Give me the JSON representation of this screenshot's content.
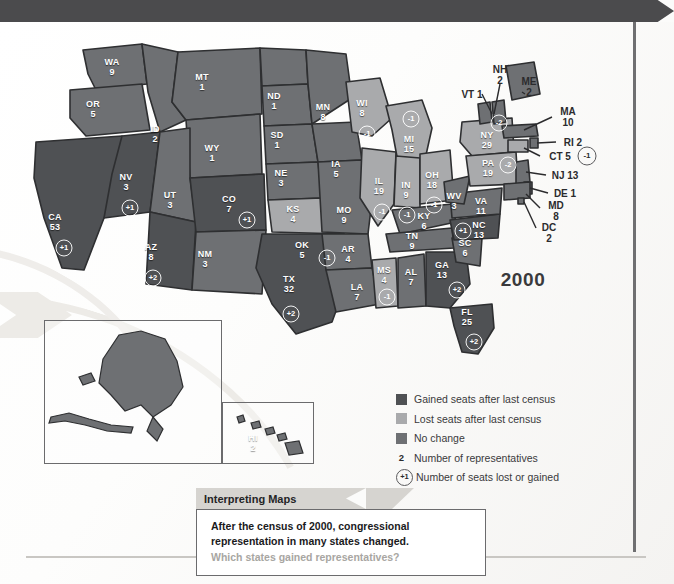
{
  "map": {
    "year_label": "2000",
    "title_hidden": "",
    "colors": {
      "gained": "#4f5154",
      "lost": "#a9aaac",
      "no_change": "#6e7073",
      "border": "#2e2f31",
      "banner": "#4b4b4d",
      "paper": "#fbfbfa",
      "question_gray": "#a8a6a2"
    },
    "states": [
      {
        "code": "WA",
        "seats": "9",
        "change": null,
        "status": "no_change",
        "x": 112,
        "y": 45
      },
      {
        "code": "OR",
        "seats": "5",
        "change": null,
        "status": "no_change",
        "x": 93,
        "y": 87
      },
      {
        "code": "CA",
        "seats": "53",
        "change": "+1",
        "status": "gained",
        "x": 55,
        "y": 200,
        "bx": 64,
        "by": 226
      },
      {
        "code": "NV",
        "seats": "3",
        "change": "+1",
        "status": "gained",
        "x": 126,
        "y": 160,
        "bx": 130,
        "by": 186
      },
      {
        "code": "ID",
        "seats": "2",
        "change": null,
        "status": "no_change",
        "x": 155,
        "y": 112
      },
      {
        "code": "MT",
        "seats": "1",
        "change": null,
        "status": "no_change",
        "x": 202,
        "y": 60
      },
      {
        "code": "WY",
        "seats": "1",
        "change": null,
        "status": "no_change",
        "x": 212,
        "y": 131
      },
      {
        "code": "UT",
        "seats": "3",
        "change": null,
        "status": "no_change",
        "x": 170,
        "y": 178
      },
      {
        "code": "AZ",
        "seats": "8",
        "change": "+2",
        "status": "gained",
        "x": 151,
        "y": 230,
        "bx": 153,
        "by": 256
      },
      {
        "code": "CO",
        "seats": "7",
        "change": "+1",
        "status": "gained",
        "x": 229,
        "y": 182,
        "bx": 247,
        "by": 198
      },
      {
        "code": "NM",
        "seats": "3",
        "change": null,
        "status": "no_change",
        "x": 205,
        "y": 237
      },
      {
        "code": "ND",
        "seats": "1",
        "change": null,
        "status": "no_change",
        "x": 274,
        "y": 79
      },
      {
        "code": "SD",
        "seats": "1",
        "change": null,
        "status": "no_change",
        "x": 277,
        "y": 118
      },
      {
        "code": "NE",
        "seats": "3",
        "change": null,
        "status": "no_change",
        "x": 281,
        "y": 156
      },
      {
        "code": "KS",
        "seats": "4",
        "change": null,
        "status": "no_change",
        "x": 293,
        "y": 192
      },
      {
        "code": "OK",
        "seats": "5",
        "change": "-1",
        "status": "lost",
        "x": 302,
        "y": 228,
        "bx": 327,
        "by": 236
      },
      {
        "code": "TX",
        "seats": "32",
        "change": "+2",
        "status": "gained",
        "x": 289,
        "y": 262,
        "bx": 291,
        "by": 292
      },
      {
        "code": "MN",
        "seats": "8",
        "change": null,
        "status": "no_change",
        "x": 323,
        "y": 90
      },
      {
        "code": "IA",
        "seats": "5",
        "change": null,
        "status": "no_change",
        "x": 336,
        "y": 147
      },
      {
        "code": "MO",
        "seats": "9",
        "change": null,
        "status": "no_change",
        "x": 344,
        "y": 193
      },
      {
        "code": "AR",
        "seats": "4",
        "change": null,
        "status": "no_change",
        "x": 348,
        "y": 232
      },
      {
        "code": "LA",
        "seats": "7",
        "change": null,
        "status": "no_change",
        "x": 357,
        "y": 270
      },
      {
        "code": "WI",
        "seats": "8",
        "change": "-1",
        "status": "lost",
        "x": 362,
        "y": 86,
        "bx": 367,
        "by": 112
      },
      {
        "code": "IL",
        "seats": "19",
        "change": "-1",
        "status": "lost",
        "x": 379,
        "y": 164,
        "bx": 382,
        "by": 190
      },
      {
        "code": "MI",
        "seats": "15",
        "change": "-1",
        "status": "lost",
        "x": 409,
        "y": 122,
        "bx": 411,
        "by": 97
      },
      {
        "code": "IN",
        "seats": "9",
        "change": "-1",
        "status": "lost",
        "x": 406,
        "y": 168,
        "bx": 407,
        "by": 193
      },
      {
        "code": "OH",
        "seats": "18",
        "change": "-1",
        "status": "lost",
        "x": 432,
        "y": 158,
        "bx": 434,
        "by": 183
      },
      {
        "code": "KY",
        "seats": "6",
        "change": null,
        "status": "no_change",
        "x": 424,
        "y": 199
      },
      {
        "code": "TN",
        "seats": "9",
        "change": null,
        "status": "no_change",
        "x": 412,
        "y": 219
      },
      {
        "code": "MS",
        "seats": "4",
        "change": "-1",
        "status": "lost",
        "x": 384,
        "y": 253,
        "bx": 387,
        "by": 275
      },
      {
        "code": "AL",
        "seats": "7",
        "change": null,
        "status": "no_change",
        "x": 411,
        "y": 255
      },
      {
        "code": "GA",
        "seats": "13",
        "change": "+2",
        "status": "gained",
        "x": 442,
        "y": 248,
        "bx": 457,
        "by": 268
      },
      {
        "code": "FL",
        "seats": "25",
        "change": "+2",
        "status": "gained",
        "x": 467,
        "y": 295,
        "bx": 474,
        "by": 320
      },
      {
        "code": "SC",
        "seats": "6",
        "change": null,
        "status": "no_change",
        "x": 465,
        "y": 226
      },
      {
        "code": "NC",
        "seats": "13",
        "change": "+1",
        "status": "gained",
        "x": 479,
        "y": 208,
        "bx": 463,
        "by": 209
      },
      {
        "code": "VA",
        "seats": "11",
        "change": null,
        "status": "no_change",
        "x": 481,
        "y": 184
      },
      {
        "code": "WV",
        "seats": "3",
        "change": null,
        "status": "no_change",
        "x": 454,
        "y": 179
      },
      {
        "code": "NY",
        "seats": "29",
        "change": "-2",
        "status": "lost",
        "x": 487,
        "y": 118,
        "bx": 499,
        "by": 101
      },
      {
        "code": "PA",
        "seats": "19",
        "change": "-2",
        "status": "lost",
        "x": 488,
        "y": 146,
        "bx": 508,
        "by": 143
      }
    ],
    "insets": [
      {
        "code": "AK",
        "seats": "1",
        "status": "no_change",
        "x": 127,
        "y": 352
      },
      {
        "code": "HI",
        "seats": "2",
        "status": "no_change",
        "x": 253,
        "y": 421
      }
    ],
    "callouts": [
      {
        "code": "NH",
        "seats": "2",
        "text": "NH\n2",
        "x": 500,
        "y": 53
      },
      {
        "code": "ME",
        "seats": "2",
        "text": "ME\n2",
        "x": 529,
        "y": 65
      },
      {
        "code": "VT",
        "seats": "1",
        "text": "VT 1",
        "x": 472,
        "y": 72
      },
      {
        "code": "MA",
        "seats": "10",
        "text": "MA\n10",
        "x": 568,
        "y": 95
      },
      {
        "code": "RI",
        "seats": "2",
        "text": "RI 2",
        "x": 573,
        "y": 120
      },
      {
        "code": "CT",
        "seats": "5",
        "text": "CT 5",
        "x": 560,
        "y": 134,
        "badge": "-1",
        "bx": 587,
        "by": 134
      },
      {
        "code": "NJ",
        "seats": "13",
        "text": "NJ 13",
        "x": 565,
        "y": 153
      },
      {
        "code": "DE",
        "seats": "1",
        "text": "DE 1",
        "x": 565,
        "y": 171
      },
      {
        "code": "MD",
        "seats": "8",
        "text": "MD\n8",
        "x": 556,
        "y": 189
      },
      {
        "code": "DC",
        "seats": "2",
        "text": "DC\n2",
        "x": 549,
        "y": 211
      }
    ]
  },
  "legend": {
    "items": [
      {
        "marker": "swatch-gained",
        "label": "Gained seats after last census"
      },
      {
        "marker": "swatch-lost",
        "label": "Lost seats after last census"
      },
      {
        "marker": "swatch-no-change",
        "label": "No change"
      },
      {
        "marker": "number-2",
        "label": "Number of representatives",
        "symbol": "2"
      },
      {
        "marker": "circle-plus-one",
        "label": "Number of seats lost or gained",
        "symbol": "+1"
      }
    ]
  },
  "caption": {
    "tab_title": "Interpreting Maps",
    "line1": "After the census of 2000, congressional",
    "line2": "representation in many states changed.",
    "question": "Which states gained representatives?"
  }
}
